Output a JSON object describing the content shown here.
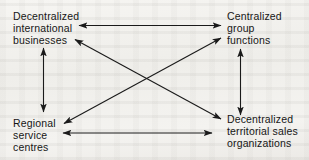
{
  "diagram": {
    "background_color": "#f2f1ee",
    "line_color": "#1a1a1a",
    "text_color": "#161616",
    "nodes": [
      {
        "id": "decentralized-international-businesses",
        "position": "top-left",
        "lines": [
          "Decentralized",
          "international",
          "businesses"
        ]
      },
      {
        "id": "centralized-group-functions",
        "position": "top-right",
        "lines": [
          "Centralized",
          "group",
          "functions"
        ]
      },
      {
        "id": "regional-service-centres",
        "position": "bottom-left",
        "lines": [
          "Regional",
          "service",
          "centres"
        ]
      },
      {
        "id": "decentralized-territorial-sales-organizations",
        "position": "bottom-right",
        "lines": [
          "Decentralized",
          "territorial sales",
          "organizations"
        ]
      }
    ],
    "connectors": [
      {
        "id": "top-horizontal",
        "from": "decentralized-international-businesses",
        "to": "centralized-group-functions",
        "style": "double-headed",
        "orientation": "horizontal"
      },
      {
        "id": "bottom-horizontal",
        "from": "regional-service-centres",
        "to": "decentralized-territorial-sales-organizations",
        "style": "double-headed",
        "orientation": "horizontal"
      },
      {
        "id": "left-vertical",
        "from": "decentralized-international-businesses",
        "to": "regional-service-centres",
        "style": "double-headed",
        "orientation": "vertical"
      },
      {
        "id": "right-vertical",
        "from": "centralized-group-functions",
        "to": "decentralized-territorial-sales-organizations",
        "style": "double-headed",
        "orientation": "vertical"
      },
      {
        "id": "diagonal-tl-br",
        "from": "decentralized-international-businesses",
        "to": "decentralized-territorial-sales-organizations",
        "style": "double-headed",
        "orientation": "diagonal"
      },
      {
        "id": "diagonal-bl-tr",
        "from": "regional-service-centres",
        "to": "centralized-group-functions",
        "style": "double-headed",
        "orientation": "diagonal"
      }
    ]
  }
}
